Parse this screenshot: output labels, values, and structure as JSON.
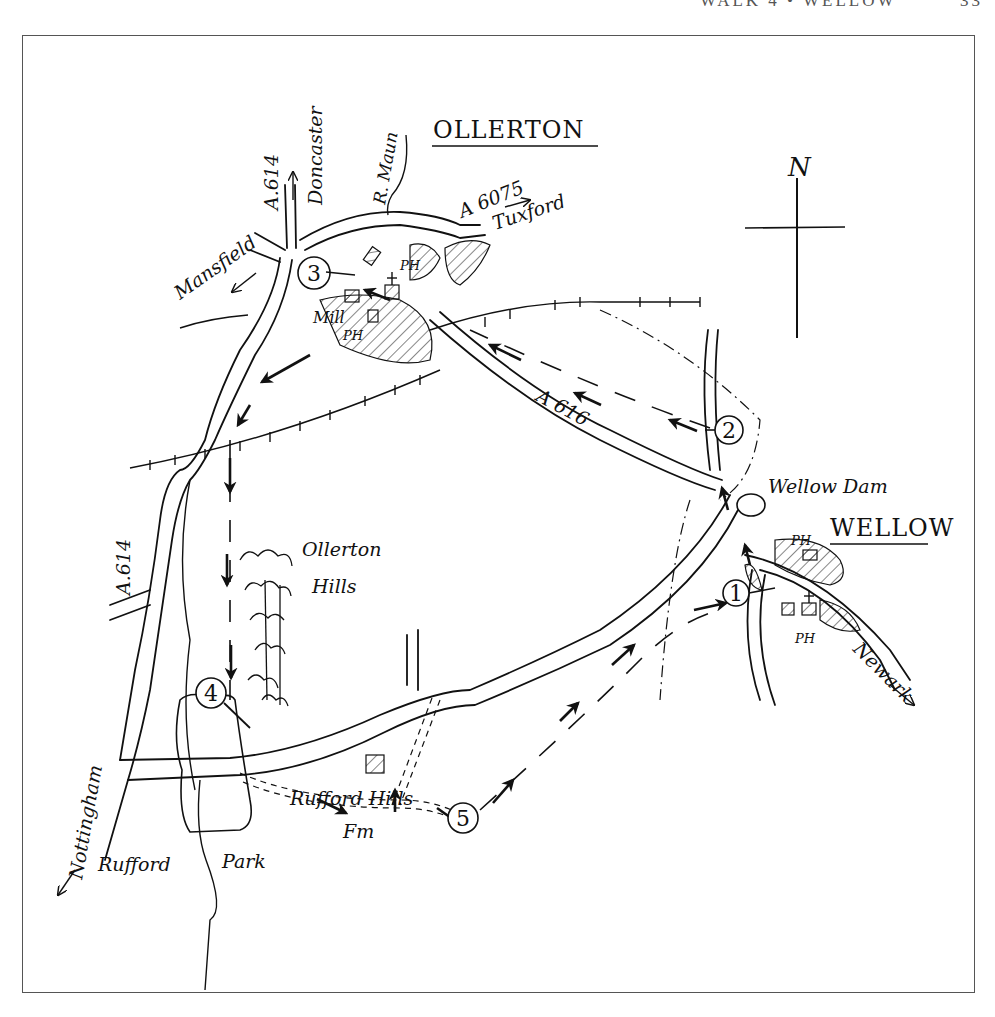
{
  "page": {
    "running_head": "WALK 4 • WELLOW",
    "page_number": "33"
  },
  "map": {
    "towns": [
      {
        "name": "OLLERTON"
      },
      {
        "name": "WELLOW"
      }
    ],
    "labels": {
      "doncaster": "Doncaster",
      "a614_north": "A.614",
      "r_maun": "R. Maun",
      "a6075": "A 6075",
      "tuxford": "Tuxford",
      "mansfield": "Mansfield",
      "mill": "Mill",
      "ph_ollerton_1": "PH",
      "ph_ollerton_2": "PH",
      "a616": "A 616",
      "wellow_dam": "Wellow Dam",
      "ph_wellow_1": "PH",
      "ph_wellow_2": "PH",
      "newark": "Newark",
      "a614_south": "A.614",
      "ollerton_hills_1": "Ollerton",
      "ollerton_hills_2": "Hills",
      "nottingham": "Nottingham",
      "rufford": "Rufford",
      "park": "Park",
      "rufford_hills_1": "Rufford Hills",
      "rufford_hills_2": "Fm",
      "north": "N"
    },
    "waypoints": [
      "1",
      "2",
      "3",
      "4",
      "5"
    ]
  }
}
